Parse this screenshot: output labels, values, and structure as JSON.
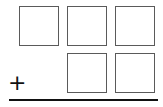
{
  "problem": {
    "operator": "+",
    "rows": [
      {
        "digits": [
          "",
          "",
          ""
        ]
      },
      {
        "digits": [
          "",
          ""
        ]
      }
    ]
  },
  "colors": {
    "box_border": "#5a5a5a",
    "rule": "#111111"
  }
}
